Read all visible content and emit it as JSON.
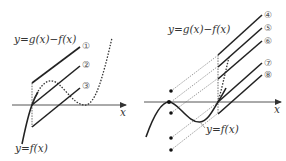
{
  "left_panel": {
    "x_axis_label": "x",
    "curve_g_minus_f_label": "y=g(x)−f(x)",
    "curve_f_label": "y=f(x)",
    "line_labels": [
      "①",
      "②",
      "③"
    ]
  },
  "right_panel": {
    "x_axis_label": "x",
    "curve_g_minus_f_label": "y=g(x)−f(x)",
    "curve_f_label": "y=f(x)",
    "line_labels": [
      "④",
      "⑤",
      "⑥",
      "⑦",
      "⑧"
    ],
    "dot_count": 5
  },
  "colors": {
    "line": "#222222",
    "axis": "#555555",
    "background": "#ffffff"
  }
}
